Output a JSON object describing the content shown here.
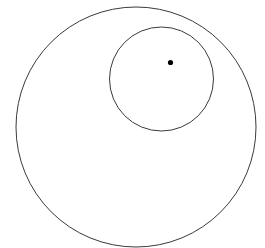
{
  "figure": {
    "background_color": "#ffffff",
    "width": 265,
    "height": 248,
    "stroke_color": "#333333",
    "dot_color": "#000000",
    "shapes": [
      {
        "name": "outer-circle",
        "type": "circle",
        "cx": 136,
        "cy": 127,
        "r": 120,
        "stroke": "#3a3a3a",
        "stroke_width": 1,
        "fill": "none",
        "label": ""
      },
      {
        "name": "inner-circle",
        "type": "circle",
        "cx": 161.5,
        "cy": 79,
        "r": 52,
        "stroke": "#3a3a3a",
        "stroke_width": 1,
        "fill": "none",
        "label": ""
      },
      {
        "name": "center-point",
        "type": "dot",
        "cx": 170.5,
        "cy": 62.5,
        "r": 2.6,
        "stroke": "none",
        "stroke_width": 0,
        "fill": "#000000",
        "label": ""
      }
    ],
    "annotations": []
  }
}
